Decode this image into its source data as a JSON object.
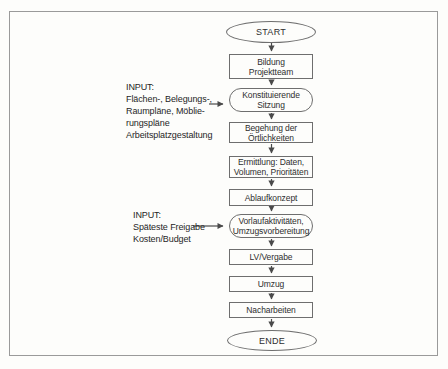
{
  "diagram": {
    "type": "flowchart",
    "language": "de",
    "nodes": [
      {
        "id": "start",
        "shape": "ellipse",
        "label": "START"
      },
      {
        "id": "bildung-projektteam",
        "shape": "rect",
        "label": "Bildung\nProjektteam"
      },
      {
        "id": "konstituierende-sitzung",
        "shape": "stadium",
        "label": "Konstituierende\nSitzung"
      },
      {
        "id": "begehung-oertlichkeiten",
        "shape": "rect",
        "label": "Begehung der\nÖrtlichkeiten"
      },
      {
        "id": "ermittlung",
        "shape": "rect",
        "label": "Ermittlung: Daten,\nVolumen, Prioritäten"
      },
      {
        "id": "ablaufkonzept",
        "shape": "rect",
        "label": "Ablaufkonzept"
      },
      {
        "id": "vorlaufaktivitaeten",
        "shape": "stadium",
        "label": "Vorlaufaktivitäten,\nUmzugsvorbereitung"
      },
      {
        "id": "lv-vergabe",
        "shape": "rect",
        "label": "LV/Vergabe"
      },
      {
        "id": "umzug",
        "shape": "rect",
        "label": "Umzug"
      },
      {
        "id": "nacharbeiten",
        "shape": "rect",
        "label": "Nacharbeiten"
      },
      {
        "id": "ende",
        "shape": "ellipse",
        "label": "ENDE"
      }
    ],
    "inputs": [
      {
        "id": "input-1",
        "label": "INPUT:\nFlächen-, Belegungs-,\nRaumpläne, Möblie-\nrungspläne\nArbeitsplatzgestaltung"
      },
      {
        "id": "input-2",
        "label": "INPUT:\nSpäteste Freigabe\nKosten/Budget"
      }
    ],
    "colors": {
      "background": "#fdfdfb",
      "frame_border": "#9a9a9a",
      "node_border": "#6e6e6e",
      "arrow": "#4a4a4a",
      "text": "#2e2e2e"
    }
  }
}
